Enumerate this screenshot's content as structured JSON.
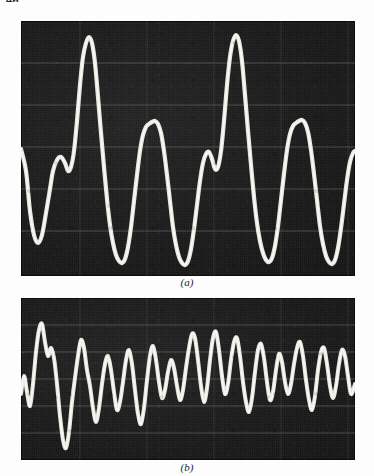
{
  "page": {
    "folio": "46",
    "background_color": "#ffffff"
  },
  "figure": {
    "panels": [
      {
        "id": "a",
        "caption": "(a)",
        "kind": "oscillogram",
        "trace_color": "#f2f0e8",
        "background_color": "#1b1b1b",
        "graticule_color": "#6b6b6b",
        "description": "Periodic voiced speech waveform, four large glottal pulses"
      },
      {
        "id": "b",
        "caption": "(b)",
        "kind": "oscillogram",
        "trace_color": "#f2f0e8",
        "background_color": "#1b1b1b",
        "graticule_color": "#6b6b6b",
        "description": "Irregular higher-frequency waveform, many small peaks"
      }
    ]
  },
  "chart_data": [
    {
      "type": "line",
      "title": "(a)",
      "xlabel": "",
      "ylabel": "",
      "grid": true,
      "legend": "none",
      "xlim": [
        0,
        334
      ],
      "ylim": [
        0,
        255
      ],
      "graticule_y": [
        42,
        84,
        126,
        168,
        210
      ],
      "graticule_x": [
        59,
        126,
        193,
        260,
        327
      ],
      "series": [
        {
          "name": "voiced-speech-trace",
          "points": [
            [
              0,
              128
            ],
            [
              5,
              150
            ],
            [
              9,
              190
            ],
            [
              13,
              214
            ],
            [
              17,
              222
            ],
            [
              21,
              214
            ],
            [
              25,
              192
            ],
            [
              29,
              168
            ],
            [
              32,
              150
            ],
            [
              36,
              139
            ],
            [
              40,
              136
            ],
            [
              44,
              142
            ],
            [
              47,
              150
            ],
            [
              50,
              146
            ],
            [
              53,
              130
            ],
            [
              56,
              100
            ],
            [
              59,
              64
            ],
            [
              62,
              36
            ],
            [
              65,
              22
            ],
            [
              68,
              16
            ],
            [
              71,
              22
            ],
            [
              74,
              42
            ],
            [
              77,
              76
            ],
            [
              80,
              112
            ],
            [
              83,
              146
            ],
            [
              86,
              178
            ],
            [
              89,
              204
            ],
            [
              92,
              222
            ],
            [
              95,
              234
            ],
            [
              98,
              240
            ],
            [
              101,
              242
            ],
            [
              104,
              238
            ],
            [
              107,
              226
            ],
            [
              110,
              206
            ],
            [
              113,
              180
            ],
            [
              116,
              154
            ],
            [
              119,
              130
            ],
            [
              122,
              114
            ],
            [
              125,
              106
            ],
            [
              128,
              103
            ],
            [
              131,
              101
            ],
            [
              134,
              100
            ],
            [
              137,
              103
            ],
            [
              140,
              112
            ],
            [
              143,
              130
            ],
            [
              146,
              154
            ],
            [
              149,
              180
            ],
            [
              152,
              206
            ],
            [
              155,
              224
            ],
            [
              158,
              236
            ],
            [
              161,
              242
            ],
            [
              164,
              244
            ],
            [
              167,
              240
            ],
            [
              170,
              228
            ],
            [
              173,
              208
            ],
            [
              176,
              184
            ],
            [
              179,
              160
            ],
            [
              182,
              142
            ],
            [
              185,
              133
            ],
            [
              188,
              131
            ],
            [
              191,
              138
            ],
            [
              194,
              148
            ],
            [
              197,
              146
            ],
            [
              200,
              130
            ],
            [
              203,
              100
            ],
            [
              206,
              64
            ],
            [
              209,
              36
            ],
            [
              212,
              20
            ],
            [
              215,
              14
            ],
            [
              218,
              20
            ],
            [
              221,
              40
            ],
            [
              224,
              74
            ],
            [
              227,
              110
            ],
            [
              230,
              144
            ],
            [
              233,
              176
            ],
            [
              236,
              202
            ],
            [
              239,
              220
            ],
            [
              242,
              232
            ],
            [
              245,
              239
            ],
            [
              248,
              241
            ],
            [
              251,
              237
            ],
            [
              254,
              225
            ],
            [
              257,
              205
            ],
            [
              260,
              179
            ],
            [
              263,
              153
            ],
            [
              266,
              129
            ],
            [
              269,
              113
            ],
            [
              272,
              105
            ],
            [
              275,
              102
            ],
            [
              278,
              100
            ],
            [
              281,
              99
            ],
            [
              284,
              102
            ],
            [
              287,
              111
            ],
            [
              290,
              129
            ],
            [
              293,
              153
            ],
            [
              296,
              179
            ],
            [
              299,
              205
            ],
            [
              302,
              223
            ],
            [
              305,
              235
            ],
            [
              308,
              241
            ],
            [
              311,
              243
            ],
            [
              314,
              239
            ],
            [
              317,
              227
            ],
            [
              320,
              207
            ],
            [
              323,
              183
            ],
            [
              326,
              159
            ],
            [
              329,
              141
            ],
            [
              332,
              132
            ],
            [
              334,
              130
            ]
          ]
        }
      ]
    },
    {
      "type": "line",
      "title": "(b)",
      "xlabel": "",
      "ylabel": "",
      "grid": true,
      "legend": "none",
      "xlim": [
        0,
        334
      ],
      "ylim": [
        0,
        162
      ],
      "graticule_y": [
        27,
        54,
        81,
        108,
        135
      ],
      "graticule_x": [
        59,
        126,
        193,
        260,
        327
      ],
      "series": [
        {
          "name": "unvoiced-speech-trace",
          "points": [
            [
              0,
              96
            ],
            [
              3,
              78
            ],
            [
              6,
              94
            ],
            [
              9,
              108
            ],
            [
              12,
              86
            ],
            [
              15,
              54
            ],
            [
              18,
              32
            ],
            [
              21,
              26
            ],
            [
              24,
              44
            ],
            [
              27,
              58
            ],
            [
              30,
              50
            ],
            [
              33,
              60
            ],
            [
              36,
              86
            ],
            [
              39,
              118
            ],
            [
              42,
              142
            ],
            [
              45,
              150
            ],
            [
              48,
              134
            ],
            [
              51,
              104
            ],
            [
              54,
              80
            ],
            [
              57,
              58
            ],
            [
              60,
              42
            ],
            [
              63,
              50
            ],
            [
              66,
              72
            ],
            [
              69,
              88
            ],
            [
              72,
              110
            ],
            [
              75,
              124
            ],
            [
              78,
              110
            ],
            [
              81,
              86
            ],
            [
              84,
              66
            ],
            [
              87,
              58
            ],
            [
              90,
              72
            ],
            [
              93,
              94
            ],
            [
              96,
              112
            ],
            [
              99,
              104
            ],
            [
              102,
              84
            ],
            [
              105,
              62
            ],
            [
              108,
              52
            ],
            [
              111,
              66
            ],
            [
              114,
              92
            ],
            [
              117,
              116
            ],
            [
              120,
              126
            ],
            [
              123,
              110
            ],
            [
              126,
              82
            ],
            [
              129,
              58
            ],
            [
              132,
              48
            ],
            [
              135,
              62
            ],
            [
              138,
              84
            ],
            [
              141,
              100
            ],
            [
              144,
              92
            ],
            [
              147,
              74
            ],
            [
              150,
              62
            ],
            [
              153,
              70
            ],
            [
              156,
              88
            ],
            [
              159,
              102
            ],
            [
              162,
              92
            ],
            [
              165,
              70
            ],
            [
              168,
              50
            ],
            [
              171,
              36
            ],
            [
              174,
              40
            ],
            [
              177,
              62
            ],
            [
              180,
              88
            ],
            [
              183,
              104
            ],
            [
              186,
              90
            ],
            [
              189,
              62
            ],
            [
              192,
              40
            ],
            [
              195,
              34
            ],
            [
              198,
              52
            ],
            [
              201,
              78
            ],
            [
              204,
              96
            ],
            [
              207,
              86
            ],
            [
              210,
              62
            ],
            [
              213,
              44
            ],
            [
              216,
              40
            ],
            [
              219,
              58
            ],
            [
              222,
              84
            ],
            [
              225,
              104
            ],
            [
              228,
              114
            ],
            [
              231,
              100
            ],
            [
              234,
              74
            ],
            [
              237,
              52
            ],
            [
              240,
              46
            ],
            [
              243,
              60
            ],
            [
              246,
              84
            ],
            [
              249,
              102
            ],
            [
              252,
              94
            ],
            [
              255,
              72
            ],
            [
              258,
              56
            ],
            [
              261,
              64
            ],
            [
              264,
              84
            ],
            [
              267,
              96
            ],
            [
              270,
              86
            ],
            [
              273,
              66
            ],
            [
              276,
              50
            ],
            [
              279,
              44
            ],
            [
              282,
              58
            ],
            [
              285,
              82
            ],
            [
              288,
              102
            ],
            [
              291,
              112
            ],
            [
              294,
              98
            ],
            [
              297,
              72
            ],
            [
              300,
              54
            ],
            [
              303,
              50
            ],
            [
              306,
              66
            ],
            [
              309,
              88
            ],
            [
              312,
              100
            ],
            [
              315,
              88
            ],
            [
              318,
              66
            ],
            [
              321,
              52
            ],
            [
              324,
              58
            ],
            [
              327,
              78
            ],
            [
              330,
              96
            ],
            [
              334,
              86
            ]
          ]
        }
      ]
    }
  ]
}
